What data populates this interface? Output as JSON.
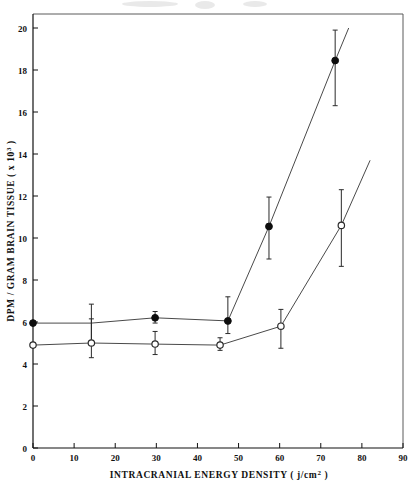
{
  "figure": {
    "background": "#ffffff",
    "ink_color": "#111111",
    "line_color": "#4a4a4a"
  },
  "chart_data": {
    "type": "line",
    "title": "",
    "subtitle": "",
    "xlabel": "INTRACRANIAL  ENERGY  DENSITY  ( j/cm² )",
    "ylabel": "DPM / GRAM BRAIN TISSUE ( x 10³ )",
    "xlim": [
      0,
      90
    ],
    "ylim": [
      0,
      20
    ],
    "xticks": [
      0,
      10,
      20,
      30,
      40,
      50,
      60,
      70,
      80,
      90
    ],
    "xticklabels": [
      "0",
      "10",
      "20",
      "30",
      "40",
      "50",
      "60",
      "70",
      "80",
      "90"
    ],
    "yticks": [
      0,
      2,
      4,
      6,
      8,
      10,
      12,
      14,
      16,
      18,
      20
    ],
    "yticklabels": [
      "0",
      "2",
      "4",
      "6",
      "8",
      "10",
      "12",
      "14",
      "16",
      "18",
      "20"
    ],
    "grid": false,
    "legend": "none",
    "legend_position": "none",
    "error_bars": "vertical",
    "series": [
      {
        "name": "filled-circle-series",
        "marker": "filled-circle",
        "color": "#0d0d0d",
        "points": [
          {
            "x": 0.0,
            "y": 5.95,
            "yerr_low": 5.95,
            "yerr_high": 5.95,
            "marker": true
          },
          {
            "x": 14.2,
            "y": 5.95,
            "yerr_low": 5.1,
            "yerr_high": 6.85,
            "marker": false
          },
          {
            "x": 29.7,
            "y": 6.2,
            "yerr_low": 5.95,
            "yerr_high": 6.5,
            "marker": true
          },
          {
            "x": 47.4,
            "y": 6.05,
            "yerr_low": 5.45,
            "yerr_high": 7.2,
            "marker": true
          },
          {
            "x": 57.4,
            "y": 10.55,
            "yerr_low": 9.0,
            "yerr_high": 11.95,
            "marker": true
          },
          {
            "x": 73.5,
            "y": 18.45,
            "yerr_low": 16.3,
            "yerr_high": 19.9,
            "marker": true
          }
        ],
        "line_extends_to": {
          "x": 76.8,
          "y": 20.0
        }
      },
      {
        "name": "open-circle-series",
        "marker": "open-circle",
        "color": "#2a2a2a",
        "points": [
          {
            "x": 0.0,
            "y": 4.9,
            "yerr_low": 4.9,
            "yerr_high": 4.9,
            "marker": true
          },
          {
            "x": 14.2,
            "y": 5.0,
            "yerr_low": 4.3,
            "yerr_high": 6.15,
            "marker": true
          },
          {
            "x": 29.7,
            "y": 4.95,
            "yerr_low": 4.45,
            "yerr_high": 5.55,
            "marker": true
          },
          {
            "x": 45.5,
            "y": 4.9,
            "yerr_low": 4.65,
            "yerr_high": 5.25,
            "marker": true
          },
          {
            "x": 60.3,
            "y": 5.8,
            "yerr_low": 4.75,
            "yerr_high": 6.6,
            "marker": true
          },
          {
            "x": 75.0,
            "y": 10.6,
            "yerr_low": 8.65,
            "yerr_high": 12.3,
            "marker": true
          }
        ],
        "line_extends_to": {
          "x": 82.0,
          "y": 13.7
        }
      }
    ]
  }
}
